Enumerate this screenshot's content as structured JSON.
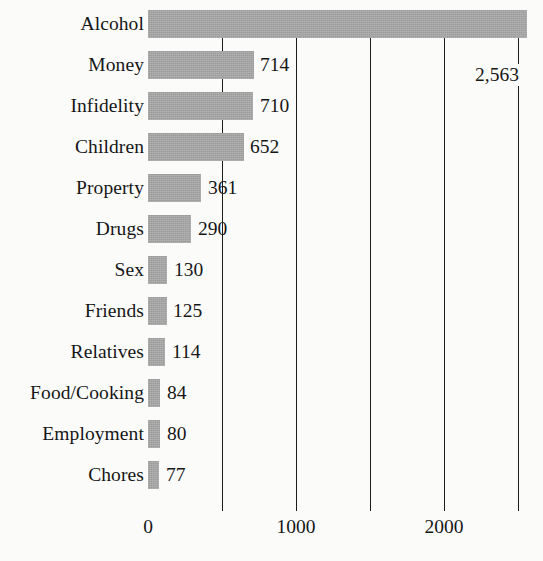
{
  "chart_data": {
    "type": "bar",
    "orientation": "horizontal",
    "title": "",
    "subtitle": "",
    "xlabel": "",
    "ylabel": "",
    "xlim": [
      0,
      2600
    ],
    "grid": "vertical",
    "legend": "none",
    "categories": [
      "Alcohol",
      "Money",
      "Infidelity",
      "Children",
      "Property",
      "Drugs",
      "Sex",
      "Friends",
      "Relatives",
      "Food/Cooking",
      "Employment",
      "Chores"
    ],
    "values": [
      2563,
      714,
      710,
      652,
      361,
      290,
      130,
      125,
      114,
      84,
      80,
      77
    ],
    "value_labels": [
      "2,563",
      "714",
      "710",
      "652",
      "361",
      "290",
      "130",
      "125",
      "114",
      "84",
      "80",
      "77"
    ],
    "xticks": [
      0,
      1000,
      2000
    ],
    "xtick_labels": [
      "0",
      "1000",
      "2000"
    ],
    "gridline_values": [
      500,
      1000,
      1500,
      2000,
      2500
    ],
    "bar_color": "#9b9b9b",
    "gridline_color": "#1b1b1b",
    "text_color": "#161616",
    "background_color": "#fbfbfa"
  }
}
